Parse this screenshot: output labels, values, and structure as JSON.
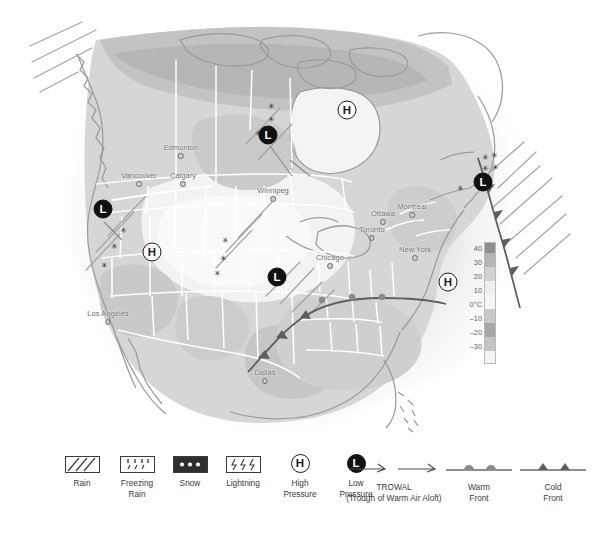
{
  "figure": {
    "kind": "weather-map",
    "region": "North America"
  },
  "map": {
    "cities": [
      {
        "name": "Edmonton",
        "x": 181,
        "y": 152
      },
      {
        "name": "Calgary",
        "x": 183,
        "y": 180
      },
      {
        "name": "Vancouver",
        "x": 139,
        "y": 180
      },
      {
        "name": "Winnipeg",
        "x": 273,
        "y": 195
      },
      {
        "name": "Ottawa",
        "x": 383,
        "y": 218
      },
      {
        "name": "Montreal",
        "x": 410,
        "y": 211
      },
      {
        "name": "Toronto",
        "x": 374,
        "y": 234
      },
      {
        "name": "New York",
        "x": 415,
        "y": 254
      },
      {
        "name": "Chicago",
        "x": 330,
        "y": 262
      },
      {
        "name": "Los Angeles",
        "x": 108,
        "y": 318
      },
      {
        "name": "Dallas",
        "x": 265,
        "y": 377
      }
    ],
    "pressure_systems": [
      {
        "type": "L",
        "label": "L",
        "x": 268,
        "y": 135
      },
      {
        "type": "H",
        "label": "H",
        "x": 347,
        "y": 110
      },
      {
        "type": "L",
        "label": "L",
        "x": 483,
        "y": 182
      },
      {
        "type": "L",
        "label": "L",
        "x": 103,
        "y": 209
      },
      {
        "type": "H",
        "label": "H",
        "x": 152,
        "y": 252
      },
      {
        "type": "L",
        "label": "L",
        "x": 277,
        "y": 277
      },
      {
        "type": "H",
        "label": "H",
        "x": 448,
        "y": 282
      }
    ],
    "snow_marks": [
      {
        "x": 270,
        "y": 106
      },
      {
        "x": 270,
        "y": 119
      },
      {
        "x": 257,
        "y": 133
      },
      {
        "x": 484,
        "y": 157
      },
      {
        "x": 492,
        "y": 155
      },
      {
        "x": 484,
        "y": 168
      },
      {
        "x": 493,
        "y": 167
      },
      {
        "x": 459,
        "y": 188
      },
      {
        "x": 122,
        "y": 230
      },
      {
        "x": 113,
        "y": 246
      },
      {
        "x": 103,
        "y": 265
      },
      {
        "x": 224,
        "y": 240
      },
      {
        "x": 222,
        "y": 258
      },
      {
        "x": 216,
        "y": 273
      }
    ],
    "temperature_scale": {
      "unit": "°C",
      "ticks": [
        "40",
        "30",
        "20",
        "10",
        "0°C",
        "–10",
        "–20",
        "–30"
      ],
      "tick_values": [
        40,
        30,
        20,
        10,
        0,
        -10,
        -20,
        -30
      ],
      "segment_colors": [
        "#8f8f8f",
        "#b4b4b4",
        "#d2d2d2",
        "#efefef",
        "#f7f7f7",
        "#c9c9c9",
        "#a7a7a7",
        "#c4c4c4",
        "#f4f4f4"
      ]
    },
    "colors": {
      "land_light": "#ededed",
      "land_mid": "#d8d8d8",
      "land_dark": "#bfbfbf",
      "coast_line": "#9a9a9a",
      "border_line": "#ffffff",
      "front_line": "#5a5a5a",
      "hatch_line": "#a8a8a8"
    }
  },
  "legend": {
    "items": [
      {
        "id": "rain",
        "symbol": "rain-hatch-box",
        "caption": "Rain"
      },
      {
        "id": "freezing-rain",
        "symbol": "freezing-rain-box",
        "caption": "Freezing\nRain",
        "line1": "Freezing",
        "line2": "Rain"
      },
      {
        "id": "snow",
        "symbol": "snow-box",
        "caption": "Snow"
      },
      {
        "id": "lightning",
        "symbol": "lightning-box",
        "caption": "Lightning"
      },
      {
        "id": "high-pressure",
        "symbol": "H",
        "caption": "High\nPressure",
        "line1": "High",
        "line2": "Pressure"
      },
      {
        "id": "low-pressure",
        "symbol": "L",
        "caption": "Low\nPressure",
        "line1": "Low",
        "line2": "Pressure"
      },
      {
        "id": "trowal",
        "symbol": "trowal-arrows",
        "caption": "TROWAL",
        "line1": "TROWAL",
        "line2": "(Trough of Warm Air Aloft)"
      },
      {
        "id": "warm-front",
        "symbol": "warm-front-line",
        "caption": "Warm\nFront",
        "line1": "Warm",
        "line2": "Front"
      },
      {
        "id": "cold-front",
        "symbol": "cold-front-line",
        "caption": "Cold\nFront",
        "line1": "Cold",
        "line2": "Front"
      }
    ]
  }
}
